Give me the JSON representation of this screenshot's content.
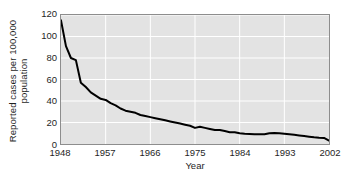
{
  "chart_data": {
    "type": "line",
    "title": "",
    "xlabel": "Year",
    "ylabel": "Reported cases per 100,000 population",
    "ylabel_lines": [
      "Reported cases per 100,000",
      "population"
    ],
    "xlim": [
      1948,
      2002
    ],
    "ylim": [
      0,
      120
    ],
    "yticks": [
      0,
      20,
      40,
      60,
      80,
      100,
      120
    ],
    "ytick_labels": [
      "0",
      "20",
      "40",
      "60",
      "80",
      "100",
      "120"
    ],
    "xticks": [
      1948,
      1957,
      1966,
      1975,
      1984,
      1993,
      2002
    ],
    "xtick_labels": [
      "1948",
      "1957",
      "1966",
      "1975",
      "1984",
      "1993",
      "2002"
    ],
    "grid": true,
    "grid_color": "#ffffff",
    "plot_background": "#e3e3e3",
    "line_color": "#000000",
    "line_width": 2,
    "legend": null,
    "legend_position": "none",
    "series": [
      {
        "name": "Reported cases per 100,000 population",
        "x": [
          1948,
          1949,
          1950,
          1951,
          1952,
          1953,
          1954,
          1955,
          1956,
          1957,
          1958,
          1959,
          1960,
          1961,
          1962,
          1963,
          1964,
          1965,
          1966,
          1967,
          1968,
          1969,
          1970,
          1971,
          1972,
          1973,
          1974,
          1975,
          1976,
          1977,
          1978,
          1979,
          1980,
          1981,
          1982,
          1983,
          1984,
          1985,
          1986,
          1987,
          1988,
          1989,
          1990,
          1991,
          1992,
          1993,
          1994,
          1995,
          1996,
          1997,
          1998,
          1999,
          2000,
          2001,
          2002
        ],
        "y": [
          115,
          91,
          80,
          78,
          57,
          53,
          48,
          45,
          42,
          41,
          38,
          36,
          33,
          31,
          30,
          29,
          27,
          26,
          25,
          24,
          23,
          22,
          21,
          20,
          19,
          18,
          17,
          15,
          16,
          15,
          14,
          13,
          13,
          12,
          11,
          11,
          10,
          9.5,
          9.3,
          9.1,
          9,
          9,
          10,
          10.3,
          10,
          9.6,
          9,
          8.5,
          8,
          7.4,
          6.8,
          6.2,
          5.8,
          5.6,
          3.2
        ]
      }
    ]
  },
  "axes": {
    "y_title_line1": "Reported cases per 100,000",
    "y_title_line2": "population",
    "x_title": "Year"
  }
}
